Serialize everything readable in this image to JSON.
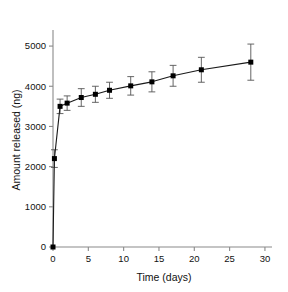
{
  "chart_data": {
    "type": "line",
    "title": "",
    "subtitle": "",
    "xlabel": "Time (days)",
    "ylabel": "Amount released (ng)",
    "xlim": [
      0,
      31
    ],
    "ylim": [
      0,
      5400
    ],
    "xticks": [
      0,
      5,
      10,
      15,
      20,
      25,
      30
    ],
    "xticklabels": [
      "0",
      "5",
      "10",
      "15",
      "20",
      "25",
      "30"
    ],
    "yticks": [
      0,
      1000,
      2000,
      3000,
      4000,
      5000
    ],
    "yticklabels": [
      "0",
      "1000",
      "2000",
      "3000",
      "4000",
      "5000"
    ],
    "grid": false,
    "legend": false,
    "legend_position": "none",
    "marker": "filled-square",
    "line_color": "#1a1a1a",
    "marker_color": "#000000",
    "errorbar_color": "#555555",
    "axis_color": "#808080",
    "series": [
      {
        "name": "Amount released",
        "x": [
          0,
          0.2,
          1,
          2,
          4,
          6,
          8,
          11,
          14,
          17,
          21,
          28
        ],
        "values": [
          0,
          2200,
          3500,
          3580,
          3720,
          3800,
          3900,
          4010,
          4110,
          4260,
          4410,
          4600
        ],
        "errors": [
          0,
          220,
          180,
          180,
          220,
          200,
          200,
          230,
          250,
          260,
          310,
          450
        ]
      }
    ]
  },
  "axes": {
    "x_label": "Time (days)",
    "y_label": "Amount released (ng)"
  }
}
